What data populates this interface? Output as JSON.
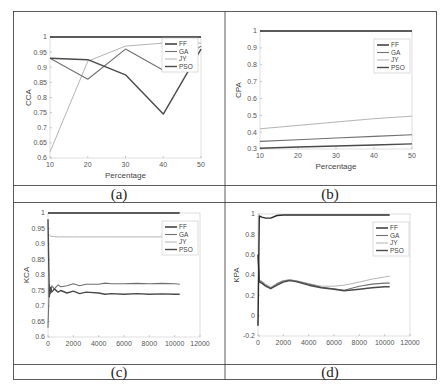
{
  "figure": {
    "captions": [
      "(a)",
      "(b)",
      "(c)",
      "(d)"
    ],
    "series_colors": {
      "FF": "#2a2a2a",
      "GA": "#707070",
      "JY": "#b4b4b4",
      "PSO": "#4a4a4a"
    }
  },
  "chart_data": [
    {
      "id": "a",
      "type": "line",
      "caption": "(a)",
      "title": "",
      "xlabel": "Percentage",
      "ylabel": "CCA",
      "xlim": [
        10,
        50
      ],
      "ylim": [
        0.6,
        1
      ],
      "xticks": [
        10,
        20,
        30,
        40,
        50
      ],
      "yticks": [
        0.6,
        0.65,
        0.7,
        0.75,
        0.8,
        0.85,
        0.9,
        0.95,
        1
      ],
      "ytick_labels": [
        "0.6",
        "0.65",
        "0.7",
        "0.75",
        "0.8",
        "0.85",
        "0.9",
        "0.95",
        "1"
      ],
      "legend": [
        "FF",
        "GA",
        "JY",
        "PSO"
      ],
      "legend_position": "upper right",
      "grid": false,
      "x": [
        10,
        20,
        30,
        40,
        50
      ],
      "series": [
        {
          "name": "FF",
          "values": [
            1,
            1,
            1,
            1,
            1
          ]
        },
        {
          "name": "GA",
          "values": [
            0.93,
            0.86,
            0.96,
            0.89,
            0.97
          ]
        },
        {
          "name": "JY",
          "values": [
            0.62,
            0.92,
            0.97,
            0.98,
            0.98
          ]
        },
        {
          "name": "PSO",
          "values": [
            0.93,
            0.925,
            0.875,
            0.745,
            0.96
          ]
        }
      ]
    },
    {
      "id": "b",
      "type": "line",
      "caption": "(b)",
      "title": "",
      "xlabel": "Percentage",
      "ylabel": "CPA",
      "xlim": [
        10,
        50
      ],
      "ylim": [
        0.3,
        1
      ],
      "xticks": [
        10,
        20,
        30,
        40,
        50
      ],
      "yticks": [
        0.3,
        0.4,
        0.5,
        0.6,
        0.7,
        0.8,
        0.9,
        1
      ],
      "ytick_labels": [
        "0.3",
        "0.4",
        "0.5",
        "0.6",
        "0.7",
        "0.8",
        "0.9",
        "1"
      ],
      "legend": [
        "FF",
        "GA",
        "JY",
        "PSO"
      ],
      "legend_position": "upper right",
      "grid": false,
      "x": [
        10,
        20,
        30,
        40,
        50
      ],
      "series": [
        {
          "name": "FF",
          "values": [
            1,
            1,
            1,
            1,
            1
          ]
        },
        {
          "name": "GA",
          "values": [
            0.345,
            0.355,
            0.365,
            0.375,
            0.385
          ]
        },
        {
          "name": "JY",
          "values": [
            0.42,
            0.44,
            0.46,
            0.48,
            0.495
          ]
        },
        {
          "name": "PSO",
          "values": [
            0.305,
            0.312,
            0.318,
            0.324,
            0.33
          ]
        }
      ]
    },
    {
      "id": "c",
      "type": "line",
      "caption": "(c)",
      "title": "",
      "xlabel": "",
      "ylabel": "KCA",
      "xlim": [
        0,
        12000
      ],
      "ylim": [
        0.6,
        1
      ],
      "xticks": [
        0,
        2000,
        4000,
        6000,
        8000,
        10000,
        12000
      ],
      "yticks": [
        0.6,
        0.65,
        0.7,
        0.75,
        0.8,
        0.85,
        0.9,
        0.95,
        1
      ],
      "ytick_labels": [
        "0.6",
        "0.65",
        "0.7",
        "0.75",
        "0.8",
        "0.85",
        "0.9",
        "0.95",
        "1"
      ],
      "legend": [
        "FF",
        "GA",
        "JY",
        "PSO"
      ],
      "legend_position": "upper right",
      "grid": false,
      "x": [
        0,
        100,
        200,
        300,
        500,
        800,
        1000,
        1500,
        2000,
        2500,
        3000,
        4000,
        4500,
        5000,
        6000,
        7000,
        8000,
        9000,
        10000,
        10400
      ],
      "series": [
        {
          "name": "FF",
          "values": [
            1,
            1,
            1,
            1,
            1,
            1,
            1,
            1,
            1,
            1,
            1,
            1,
            1,
            1,
            1,
            1,
            1,
            1,
            1,
            1
          ]
        },
        {
          "name": "GA",
          "values": [
            0.63,
            0.77,
            0.74,
            0.765,
            0.755,
            0.768,
            0.762,
            0.765,
            0.772,
            0.765,
            0.77,
            0.77,
            0.774,
            0.772,
            0.772,
            0.773,
            0.772,
            0.773,
            0.772,
            0.77
          ]
        },
        {
          "name": "JY",
          "values": [
            0.93,
            0.93,
            0.925,
            0.925,
            0.924,
            0.923,
            0.923,
            0.923,
            0.923,
            0.923,
            0.923,
            0.923,
            0.923,
            0.923,
            0.923,
            0.923,
            0.923,
            0.923,
            0.923,
            0.923
          ]
        },
        {
          "name": "PSO",
          "values": [
            0.98,
            0.73,
            0.76,
            0.745,
            0.755,
            0.745,
            0.75,
            0.742,
            0.748,
            0.74,
            0.745,
            0.742,
            0.738,
            0.74,
            0.738,
            0.74,
            0.738,
            0.739,
            0.738,
            0.738
          ]
        }
      ]
    },
    {
      "id": "d",
      "type": "line",
      "caption": "(d)",
      "title": "",
      "xlabel": "",
      "ylabel": "KPA",
      "xlim": [
        0,
        12000
      ],
      "ylim": [
        -0.2,
        1
      ],
      "xticks": [
        0,
        2000,
        4000,
        6000,
        8000,
        10000,
        12000
      ],
      "yticks": [
        -0.2,
        0,
        0.2,
        0.4,
        0.6,
        0.8,
        1
      ],
      "ytick_labels": [
        "-0.2",
        "0",
        "0.2",
        "0.4",
        "0.6",
        "0.8",
        "1"
      ],
      "legend": [
        "FF",
        "GA",
        "JY",
        "PSO"
      ],
      "legend_position": "upper right",
      "grid": false,
      "x": [
        0,
        100,
        300,
        600,
        1000,
        1500,
        2000,
        2500,
        3000,
        4000,
        5000,
        6000,
        6800,
        8000,
        9000,
        10000,
        10400
      ],
      "series": [
        {
          "name": "FF",
          "values": [
            -0.1,
            0.98,
            0.97,
            0.96,
            0.96,
            0.985,
            0.99,
            0.99,
            0.99,
            0.99,
            0.99,
            0.99,
            0.99,
            0.99,
            0.99,
            0.99,
            0.99
          ]
        },
        {
          "name": "GA",
          "values": [
            0.6,
            0.34,
            0.33,
            0.3,
            0.27,
            0.31,
            0.34,
            0.35,
            0.34,
            0.31,
            0.28,
            0.265,
            0.25,
            0.29,
            0.31,
            0.32,
            0.32
          ]
        },
        {
          "name": "JY",
          "values": [
            0.6,
            0.35,
            0.34,
            0.31,
            0.28,
            0.32,
            0.345,
            0.355,
            0.345,
            0.315,
            0.29,
            0.29,
            0.3,
            0.33,
            0.36,
            0.38,
            0.39
          ]
        },
        {
          "name": "PSO",
          "values": [
            0.6,
            0.33,
            0.32,
            0.29,
            0.265,
            0.3,
            0.33,
            0.345,
            0.335,
            0.3,
            0.275,
            0.26,
            0.245,
            0.26,
            0.275,
            0.285,
            0.285
          ]
        }
      ]
    }
  ]
}
